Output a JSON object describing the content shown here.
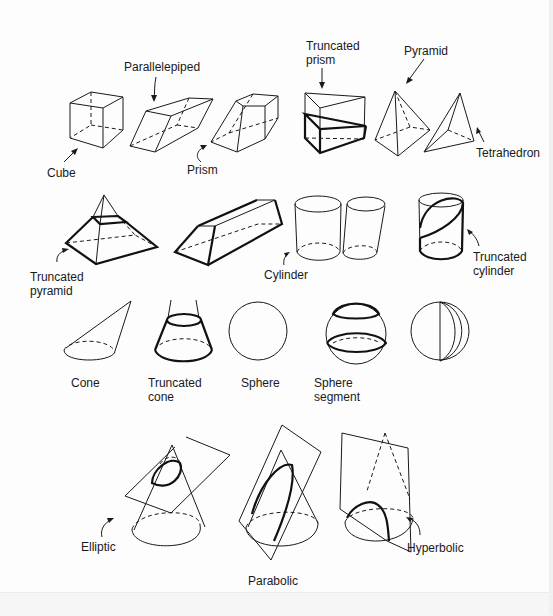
{
  "figure": {
    "rows": [
      {
        "row": "prisms-and-pyramids",
        "labels": {
          "cube": "Cube",
          "parallelepiped": "Parallelepiped",
          "prism": "Prism",
          "truncated_prism": "Truncated\nprism",
          "pyramid": "Pyramid",
          "tetrahedron": "Tetrahedron"
        }
      },
      {
        "row": "truncated-and-cylinders",
        "labels": {
          "truncated_pyramid": "Truncated\npyramid",
          "cylinder": "Cylinder",
          "truncated_cylinder": "Truncated\ncylinder"
        }
      },
      {
        "row": "round-solids",
        "labels": {
          "cone": "Cone",
          "truncated_cone": "Truncated\ncone",
          "sphere": "Sphere",
          "sphere_segment": "Sphere\nsegment"
        }
      },
      {
        "row": "conic-sections",
        "labels": {
          "elliptic": "Elliptic",
          "parabolic": "Parabolic",
          "hyperbolic": "Hyperbolic"
        }
      }
    ],
    "colors": {
      "ink": "#1a1a1a",
      "background": "#fdfdfd"
    }
  }
}
